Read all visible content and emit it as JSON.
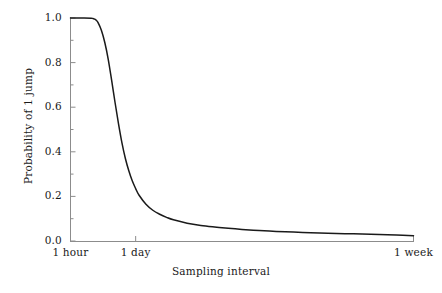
{
  "chart_data": {
    "type": "line",
    "title": "",
    "xlabel": "Sampling interval",
    "ylabel": "Probability of 1 jump",
    "grid": false,
    "legend": null,
    "legend_position": "none",
    "line_color": "#1a1a1a",
    "axis_color": "#8c8c8c",
    "background": "#ffffff",
    "ylim": [
      0.0,
      1.0
    ],
    "yticks": [
      "0.0",
      "0.2",
      "0.4",
      "0.6",
      "0.8",
      "1.0"
    ],
    "ytick_values": [
      0.0,
      0.2,
      0.4,
      0.6,
      0.8,
      1.0
    ],
    "yminor_count_between": 1,
    "xlim_labels": [
      "1 hour",
      "1 week"
    ],
    "xticks": [
      "1 hour",
      "1 day",
      "1 week"
    ],
    "xtick_fracs": [
      0.0,
      0.19,
      1.0
    ],
    "x": [
      0.0,
      0.02,
      0.04,
      0.06,
      0.065,
      0.07,
      0.075,
      0.08,
      0.09,
      0.1,
      0.11,
      0.12,
      0.13,
      0.14,
      0.15,
      0.16,
      0.17,
      0.18,
      0.19,
      0.2,
      0.22,
      0.24,
      0.26,
      0.28,
      0.3,
      0.34,
      0.38,
      0.42,
      0.46,
      0.5,
      0.55,
      0.6,
      0.65,
      0.7,
      0.75,
      0.8,
      0.85,
      0.9,
      0.95,
      1.0
    ],
    "values": [
      1.0,
      1.0,
      1.0,
      0.999,
      0.998,
      0.995,
      0.99,
      0.98,
      0.945,
      0.89,
      0.815,
      0.72,
      0.62,
      0.525,
      0.44,
      0.37,
      0.315,
      0.27,
      0.235,
      0.205,
      0.165,
      0.138,
      0.12,
      0.106,
      0.095,
      0.08,
      0.07,
      0.063,
      0.057,
      0.052,
      0.047,
      0.043,
      0.04,
      0.037,
      0.035,
      0.033,
      0.031,
      0.029,
      0.027,
      0.024
    ]
  },
  "axes": {
    "y_tick_labels": [
      "1.0",
      "0.8",
      "0.6",
      "0.4",
      "0.2",
      "0.0"
    ],
    "x_tick_labels": [
      "1 hour",
      "1 day",
      "1 week"
    ],
    "x_title": "Sampling interval",
    "y_title": "Probability of 1 jump"
  }
}
